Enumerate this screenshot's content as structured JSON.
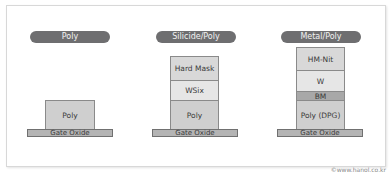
{
  "columns": [
    {
      "title": "Poly",
      "layers_top_to_bottom": [
        "Poly"
      ],
      "base": "Gate Oxide"
    },
    {
      "title": "Silicide/Poly",
      "layers_top_to_bottom": [
        "Hard Mask",
        "WSix",
        "Poly"
      ],
      "base": "Gate Oxide"
    },
    {
      "title": "Metal/Poly",
      "layers_top_to_bottom": [
        "HM-Nit",
        "W",
        "BM",
        "Poly (DPG)"
      ],
      "base": "Gate Oxide"
    }
  ],
  "credit": "©www.hanol.co.kr",
  "colors": {
    "pill": "#6e6e70",
    "poly": "#cfcfcf",
    "wsix": "#e6e6e6",
    "hard_mask": "#d8d8d8",
    "bm": "#a8a8a8",
    "gate_oxide": "#b4b4b4"
  }
}
